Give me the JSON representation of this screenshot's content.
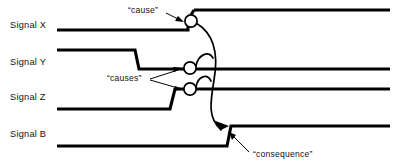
{
  "diagram": {
    "background_color": "#ffffff",
    "line_color": "#000000",
    "width": 402,
    "height": 164
  },
  "signals": [
    {
      "name": "Signal X",
      "label": "Signal X",
      "label_x": 10,
      "label_y": 28,
      "high_y": 10,
      "low_y": 30,
      "initial_level": "low",
      "transitions": [
        {
          "x": 191,
          "from": "low",
          "to": "high"
        }
      ],
      "start_x": 57,
      "end_x": 390
    },
    {
      "name": "Signal Y",
      "label": "Signal Y",
      "label_x": 10,
      "label_y": 65,
      "high_y": 50,
      "low_y": 69,
      "initial_level": "high",
      "transitions": [
        {
          "x": 135,
          "from": "high",
          "to": "low"
        }
      ],
      "start_x": 57,
      "end_x": 390
    },
    {
      "name": "Signal Z",
      "label": "Signal Z",
      "label_x": 10,
      "label_y": 100,
      "high_y": 88,
      "low_y": 109,
      "initial_level": "low",
      "transitions": [
        {
          "x": 173,
          "from": "low",
          "to": "high"
        }
      ],
      "start_x": 57,
      "end_x": 390
    },
    {
      "name": "Signal B",
      "label": "Signal B",
      "label_x": 10,
      "label_y": 137,
      "high_y": 126,
      "low_y": 146,
      "initial_level": "low",
      "transitions": [
        {
          "x": 229,
          "from": "low",
          "to": "high"
        }
      ],
      "start_x": 57,
      "end_x": 390
    }
  ],
  "event_nodes": [
    {
      "id": "node-cause-x",
      "signal": "Signal X",
      "cx": 191,
      "cy": 21,
      "r": 6.1
    },
    {
      "id": "node-cause-y",
      "signal": "Signal Y",
      "cx": 190,
      "cy": 68,
      "r": 6.1
    },
    {
      "id": "node-cause-z",
      "signal": "Signal Z",
      "cx": 190,
      "cy": 89,
      "r": 6.1
    }
  ],
  "annotations": [
    {
      "id": "cause",
      "text": "“cause”",
      "text_x": 128,
      "text_y": 13,
      "anchor": "start",
      "points_to": "node-cause-x"
    },
    {
      "id": "causes",
      "text": "“causes”",
      "text_x": 107,
      "text_y": 81,
      "anchor": "start",
      "points_to": "node-cause-y, node-cause-z"
    },
    {
      "id": "consequence",
      "text": "“consequence”",
      "text_x": 253,
      "text_y": 157,
      "anchor": "start",
      "points_to": "Signal B rising edge"
    }
  ],
  "causal_links": [
    {
      "id": "link-x-to-b",
      "from": "node-cause-x",
      "to": "Signal B rising edge",
      "style": "curved-arrow"
    },
    {
      "id": "link-y-arc",
      "from": "node-cause-y",
      "to": "link-x-to-b",
      "style": "curved-arc"
    },
    {
      "id": "link-z-arc",
      "from": "node-cause-z",
      "to": "link-x-to-b",
      "style": "curved-arc"
    }
  ]
}
